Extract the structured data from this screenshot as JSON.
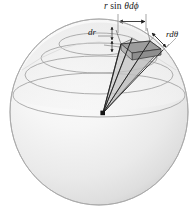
{
  "figure": {
    "kind": "spherical-volume-element-diagram",
    "width": 196,
    "height": 209,
    "background_color": "#ffffff"
  },
  "labels": {
    "arc_phi": {
      "text": "r sin θdϕ",
      "parts": {
        "r": "r",
        "sin": "sin",
        "theta_dphi": "θdϕ"
      },
      "meaning": "arc-length-azimuthal"
    },
    "radial": {
      "text": "dr",
      "meaning": "radial-thickness"
    },
    "arc_theta": {
      "text": "rdθ",
      "meaning": "arc-length-polar"
    }
  },
  "sphere": {
    "center_x": 99,
    "center_y": 112,
    "radius_x": 90,
    "radius_y": 94,
    "fill_light": "#fdfdfd",
    "fill_mid": "#ededed",
    "fill_dark": "#d8d8d8",
    "outline_color": "#a8a8a8",
    "latitude_circle_color": "#9a9a9a",
    "latitude_circle_count": 4
  },
  "volume_element": {
    "apex_x": 103,
    "apex_y": 113,
    "top_face_color": "#9d9d9d",
    "side_face_color": "#c4c4c4",
    "inner_face_color": "#b0b0b0",
    "edge_color": "#3a3a3a",
    "ray_color": "#2b2b2b",
    "ray_count": 4
  },
  "dimension_marks": {
    "phi_arrow": {
      "style": "double-headed-horizontal",
      "color": "#1f1f1f",
      "extension_line_color": "#555555"
    },
    "theta_arrow": {
      "style": "double-headed-diagonal",
      "color": "#1f1f1f"
    },
    "dr_arrow": {
      "style": "double-headed-short-leader",
      "color": "#1f1f1f"
    }
  }
}
